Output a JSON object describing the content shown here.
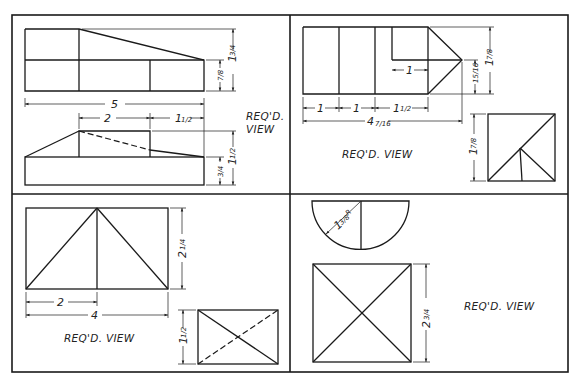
{
  "sheet": {
    "title": "Orthographic projection exercises — draw the required view",
    "panels": [
      {
        "id": "panel-1",
        "label": "REQ'D.",
        "label2": "VIEW",
        "dims": {
          "overall_length": "5",
          "box_width": "2",
          "right_offset": "1",
          "right_offset_frac": "1/2",
          "top_height_whole": "1",
          "top_height_frac": "3/4",
          "top_step": "7/8",
          "front_height_whole": "1",
          "front_height_frac": "1/2",
          "base_height": "3/4"
        }
      },
      {
        "id": "panel-2",
        "label": "REQ'D. VIEW",
        "dims": {
          "seg1": "1",
          "seg2": "1",
          "seg3_whole": "1",
          "seg3_frac": "1/2",
          "inner_len": "1",
          "overall_whole": "4",
          "overall_frac": "7/16",
          "point_height": "15/16",
          "height_whole": "1",
          "height_frac": "7/8",
          "side_height_whole": "1",
          "side_height_frac": "7/8"
        }
      },
      {
        "id": "panel-3",
        "label": "REQ'D. VIEW",
        "dims": {
          "half_width": "2",
          "width": "4",
          "height_whole": "2",
          "height_frac": "1/4",
          "side_height_whole": "1",
          "side_height_frac": "1/2"
        }
      },
      {
        "id": "panel-4",
        "label": "REQ'D. VIEW",
        "dims": {
          "radius_whole": "1",
          "radius_frac": "3/8",
          "radius_suffix": "R",
          "height_whole": "2",
          "height_frac": "3/4"
        }
      }
    ]
  }
}
